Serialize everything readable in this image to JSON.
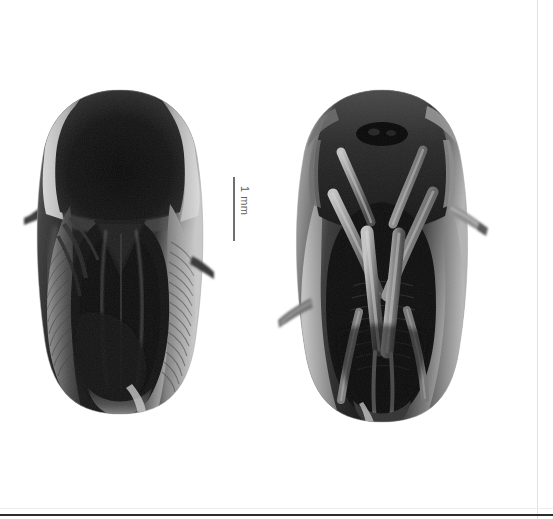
{
  "figure": {
    "background_color": "#ffffff",
    "frame_color": "#2b2b2b",
    "width": 553,
    "height": 519,
    "color_mode": "grayscale"
  },
  "scale_bar": {
    "label": "1 mm",
    "orientation": "vertical",
    "length_px": 64,
    "line_color": "#6f6f6f",
    "text_color": "#5f5f5f"
  },
  "specimens": [
    {
      "id": "specimen-left",
      "view": "dorsal",
      "subject": "leafhopper",
      "bounds": {
        "x": 28,
        "y": 90,
        "width": 175,
        "height": 320
      },
      "notes": "dark pronotum, pale lateral head margins, longitudinal wing venation"
    },
    {
      "id": "specimen-right",
      "view": "ventral",
      "subject": "leafhopper",
      "bounds": {
        "x": 282,
        "y": 88,
        "width": 195,
        "height": 335
      },
      "notes": "legs folded over venter, protruding hind leg at right"
    }
  ],
  "palette": {
    "darkest": "#0d0d0d",
    "dark": "#1d1d1d",
    "mid_dark": "#3a3a3a",
    "mid": "#585858",
    "mid_light": "#7d7d7d",
    "light": "#a8a8a8",
    "pale": "#cfcfcf",
    "palest": "#e8e8e8"
  }
}
